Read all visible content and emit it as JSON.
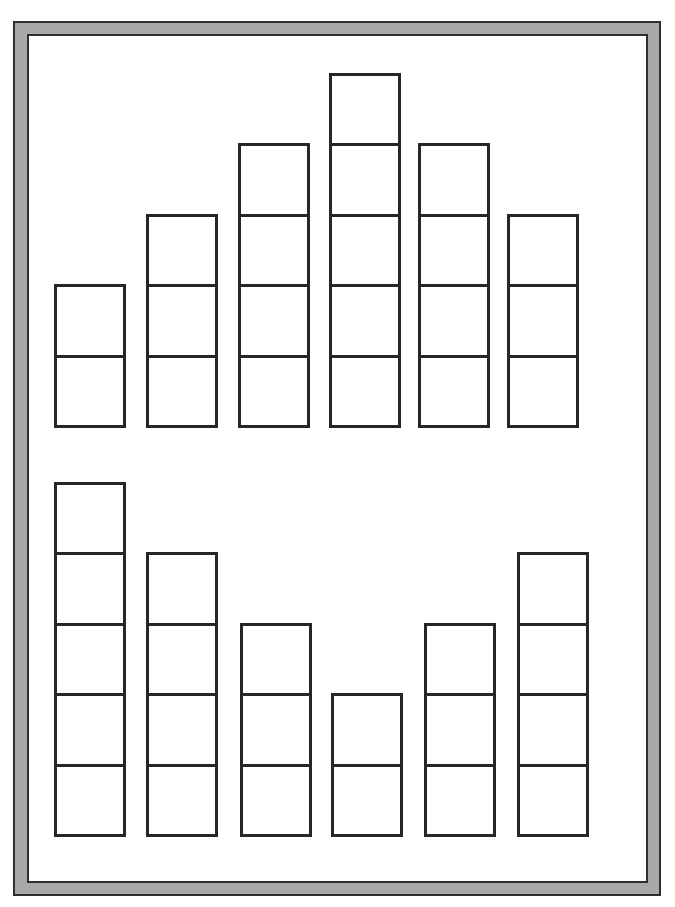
{
  "colors": {
    "frame_fill": "#a9a9a9",
    "frame_line": "#2e2e2e",
    "cell_border": "#262626",
    "background": "#ffffff"
  },
  "rows": [
    {
      "name": "top-row",
      "bottom_y": 428,
      "stacks": [
        {
          "x": 54,
          "count": 2
        },
        {
          "x": 146,
          "count": 3
        },
        {
          "x": 238,
          "count": 4
        },
        {
          "x": 329,
          "count": 5
        },
        {
          "x": 418,
          "count": 4
        },
        {
          "x": 507,
          "count": 3
        }
      ]
    },
    {
      "name": "bottom-row",
      "bottom_y": 837,
      "stacks": [
        {
          "x": 54,
          "count": 5
        },
        {
          "x": 146,
          "count": 4
        },
        {
          "x": 240,
          "count": 3
        },
        {
          "x": 331,
          "count": 2
        },
        {
          "x": 424,
          "count": 3
        },
        {
          "x": 517,
          "count": 4
        }
      ]
    }
  ]
}
